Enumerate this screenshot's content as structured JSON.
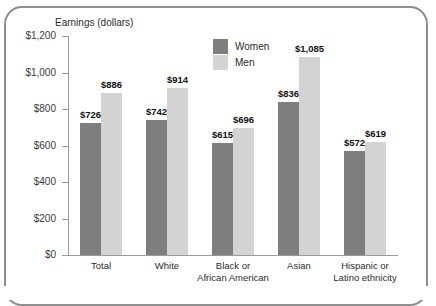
{
  "chart_data": {
    "type": "bar",
    "title": "",
    "ylabel": "Earnings (dollars)",
    "xlabel": "",
    "ylim": [
      0,
      1200
    ],
    "ytick_values": [
      0,
      200,
      400,
      600,
      800,
      1000,
      1200
    ],
    "ytick_labels": [
      "$0",
      "$200",
      "$400",
      "$600",
      "$800",
      "$1,000",
      "$1,200"
    ],
    "categories": [
      "Total",
      "White",
      "Black or\nAfrican American",
      "Asian",
      "Hispanic or\nLatino ethnicity"
    ],
    "series": [
      {
        "name": "Women",
        "color": "#7e7e7e",
        "values": [
          726,
          742,
          615,
          836,
          572
        ],
        "labels": [
          "$726",
          "$742",
          "$615",
          "$836",
          "$572"
        ]
      },
      {
        "name": "Men",
        "color": "#d3d3d3",
        "values": [
          886,
          914,
          696,
          1085,
          619
        ],
        "labels": [
          "$886",
          "$914",
          "$696",
          "$1,085",
          "$619"
        ]
      }
    ],
    "grid": false,
    "legend_position": "top-center",
    "legend_entries": [
      "Women",
      "Men"
    ]
  },
  "colors": {
    "women_bar": "#7e7e7e",
    "men_bar": "#d3d3d3",
    "axis": "#9a9a9a",
    "frame_border": "#8f8f8f",
    "text": "#2b2b2b",
    "background": "#ffffff"
  }
}
